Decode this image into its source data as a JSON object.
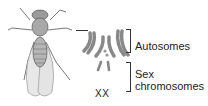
{
  "diagram": {
    "labels": {
      "autosomes": "Autosomes",
      "sex_line1": "Sex",
      "sex_line2": "chromosomes",
      "genotype": "XX"
    }
  }
}
